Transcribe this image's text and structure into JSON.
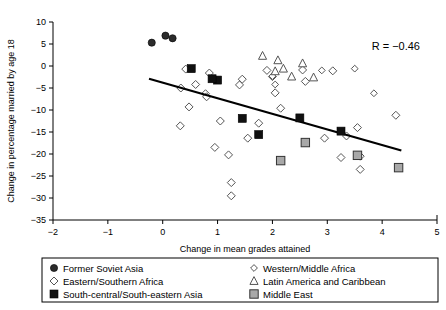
{
  "chart_data": {
    "type": "scatter",
    "title": "",
    "xlabel": "Change in mean grades attained",
    "ylabel": "Change in percentage married by age 18",
    "xlim": [
      -2,
      5
    ],
    "ylim": [
      -35,
      10
    ],
    "xticks": [
      -2,
      -1,
      0,
      1,
      2,
      3,
      4,
      5
    ],
    "xtick_labels": [
      "-2",
      "-1",
      "0",
      "1",
      "2",
      "3",
      "4",
      "5"
    ],
    "yticks": [
      -35,
      -30,
      -25,
      -20,
      -15,
      -10,
      -5,
      0,
      5,
      10
    ],
    "ytick_labels": [
      "-35",
      "-30",
      "-25",
      "-20",
      "-15",
      "-10",
      "-5",
      "0",
      "5",
      "10"
    ],
    "grid": false,
    "annotation": "R = -0.46",
    "annotation_display": "R = −0.46",
    "correlation": -0.46,
    "trendline": {
      "x0": -0.25,
      "y0": -2.9,
      "x1": 4.35,
      "y1": -19.2
    },
    "legend_position": "below-plot",
    "series": [
      {
        "name": "Former Soviet Asia",
        "marker": "filled-circle",
        "color": "#2b2b2b",
        "points": [
          [
            -0.2,
            5.3
          ],
          [
            0.05,
            6.9
          ],
          [
            0.18,
            6.3
          ]
        ]
      },
      {
        "name": "Eastern/Southern Africa",
        "marker": "open-diamond",
        "color": "#ffffff",
        "points": [
          [
            0.42,
            -0.7
          ],
          [
            0.85,
            -1.6
          ],
          [
            0.6,
            -4.2
          ],
          [
            0.78,
            -6.3
          ],
          [
            0.8,
            -7.0
          ],
          [
            0.48,
            -9.3
          ],
          [
            0.32,
            -13.6
          ],
          [
            1.05,
            -12.5
          ],
          [
            0.33,
            -5.0
          ],
          [
            1.25,
            -26.5
          ],
          [
            1.25,
            -29.5
          ],
          [
            1.2,
            -20.2
          ],
          [
            1.55,
            -16.4
          ],
          [
            0.95,
            -18.5
          ],
          [
            2.05,
            -6.1
          ],
          [
            2.15,
            -9.6
          ],
          [
            2.6,
            -3.5
          ],
          [
            2.55,
            -0.9
          ],
          [
            3.1,
            -1.1
          ],
          [
            3.55,
            -14.0
          ],
          [
            3.6,
            -20.5
          ],
          [
            3.6,
            -23.5
          ],
          [
            3.25,
            -20.8
          ],
          [
            4.25,
            -11.2
          ],
          [
            3.35,
            -15.9
          ],
          [
            2.95,
            -16.4
          ],
          [
            1.45,
            -3.0
          ],
          [
            1.4,
            -4.3
          ],
          [
            2.0,
            -2.4
          ],
          [
            1.75,
            -13.0
          ],
          [
            1.9,
            -1.0
          ]
        ]
      },
      {
        "name": "South-central/South-eastern Asia",
        "marker": "filled-square",
        "color": "#101010",
        "points": [
          [
            0.52,
            -0.6
          ],
          [
            1.0,
            -3.2
          ],
          [
            1.45,
            -11.9
          ],
          [
            1.75,
            -15.6
          ],
          [
            2.5,
            -11.8
          ],
          [
            3.25,
            -14.8
          ],
          [
            0.9,
            -2.9
          ]
        ]
      },
      {
        "name": "Western/Middle Africa",
        "marker": "open-diamond-small",
        "color": "#ffffff",
        "points": [
          [
            2.0,
            -2.3
          ],
          [
            2.05,
            -4.2
          ],
          [
            2.9,
            -1.0
          ],
          [
            3.5,
            -0.6
          ],
          [
            3.85,
            -6.2
          ]
        ]
      },
      {
        "name": "Latin America and Caribbean",
        "marker": "open-triangle",
        "color": "#ffffff",
        "points": [
          [
            1.82,
            2.3
          ],
          [
            2.1,
            1.3
          ],
          [
            2.05,
            -1.2
          ],
          [
            2.35,
            -2.4
          ],
          [
            2.55,
            0.6
          ],
          [
            2.75,
            -2.6
          ],
          [
            2.2,
            -0.6
          ]
        ]
      },
      {
        "name": "Middle East",
        "marker": "gray-square",
        "color": "#a8a8a8",
        "points": [
          [
            2.15,
            -21.5
          ],
          [
            2.6,
            -17.4
          ],
          [
            3.55,
            -20.3
          ],
          [
            4.3,
            -23.1
          ]
        ]
      }
    ]
  },
  "legend": {
    "entries": [
      {
        "label": "Former Soviet Asia",
        "marker": "filled-circle"
      },
      {
        "label": "Eastern/Southern Africa",
        "marker": "open-diamond"
      },
      {
        "label": "South-central/South-eastern Asia",
        "marker": "filled-square"
      },
      {
        "label": "Western/Middle Africa",
        "marker": "open-diamond-small"
      },
      {
        "label": "Latin America and Caribbean",
        "marker": "open-triangle"
      },
      {
        "label": "Middle East",
        "marker": "gray-square"
      }
    ]
  }
}
